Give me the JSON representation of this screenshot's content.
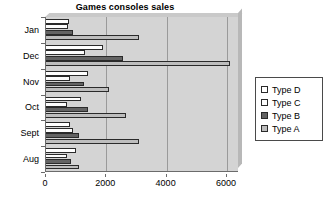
{
  "chart_data": {
    "type": "bar",
    "orientation": "horizontal",
    "title": "Games consoles sales",
    "xlabel": "",
    "ylabel": "",
    "categories": [
      "Jan",
      "Dec",
      "Nov",
      "Oct",
      "Sept",
      "Aug"
    ],
    "series": [
      {
        "name": "Type D",
        "color": "#ffffff",
        "values": [
          750,
          1900,
          1400,
          1150,
          800,
          1000
        ]
      },
      {
        "name": "Type C",
        "color": "#fdfdfd",
        "values": [
          720,
          1300,
          800,
          680,
          880,
          700
        ]
      },
      {
        "name": "Type B",
        "color": "#636363",
        "values": [
          880,
          2550,
          1250,
          1400,
          1100,
          820
        ]
      },
      {
        "name": "Type A",
        "color": "#bdbdbd",
        "values": [
          3100,
          6100,
          2100,
          2650,
          3100,
          1100
        ]
      }
    ],
    "xlim": [
      0,
      6400
    ],
    "xticks": [
      0,
      2000,
      4000,
      6000
    ],
    "xtick_labels": [
      "0",
      "2000",
      "4000",
      "6000"
    ],
    "gridlines": [
      2000,
      4000,
      6000
    ],
    "grid": true,
    "legend_position": "right",
    "legend_entries": [
      "Type D",
      "Type C",
      "Type B",
      "Type A"
    ],
    "plot_background": "#d4d4d4",
    "series_order_note": "top-to-bottom within each category group"
  }
}
